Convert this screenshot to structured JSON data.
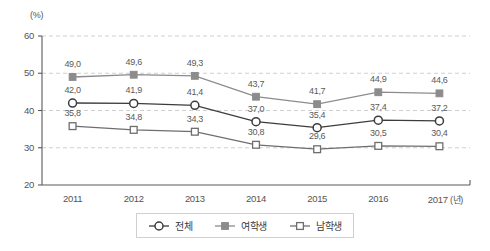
{
  "chart_data": {
    "type": "line",
    "title": "",
    "xlabel": "(년)",
    "ylabel": "(%)",
    "ylim": [
      20,
      60
    ],
    "yticks": [
      20,
      30,
      40,
      50,
      60
    ],
    "grid": true,
    "grid_style": "dashed",
    "legend_position": "bottom",
    "categories": [
      "2011",
      "2012",
      "2013",
      "2014",
      "2015",
      "2016",
      "2017"
    ],
    "series": [
      {
        "name": "전체",
        "marker": "open-circle",
        "color": "#3c3c3c",
        "values": [
          42.0,
          41.9,
          41.4,
          37.0,
          35.4,
          37.4,
          37.2
        ],
        "labels": [
          "42,0",
          "41,9",
          "41,4",
          "37,0",
          "35,4",
          "37,4",
          "37,2"
        ]
      },
      {
        "name": "여학생",
        "marker": "filled-square",
        "color": "#8c8c8c",
        "values": [
          49.0,
          49.6,
          49.3,
          43.7,
          41.7,
          44.9,
          44.6
        ],
        "labels": [
          "49,0",
          "49,6",
          "49,3",
          "43,7",
          "41,7",
          "44,9",
          "44,6"
        ]
      },
      {
        "name": "남학생",
        "marker": "open-square",
        "color": "#6e6e6e",
        "values": [
          35.8,
          34.8,
          34.3,
          30.8,
          29.6,
          30.5,
          30.4
        ],
        "labels": [
          "35,8",
          "34,8",
          "34,3",
          "30,8",
          "29,6",
          "30,5",
          "30,4"
        ]
      }
    ]
  },
  "axes": {
    "unit_label": "(%)",
    "x_unit_label": "(년)"
  },
  "legend": {
    "items": [
      {
        "label": "전체",
        "marker": "open-circle-icon"
      },
      {
        "label": "여학생",
        "marker": "filled-square-icon"
      },
      {
        "label": "남학생",
        "marker": "open-square-icon"
      }
    ]
  },
  "colors": {
    "total_line": "#3c3c3c",
    "female_line": "#8c8c8c",
    "male_line": "#6e6e6e",
    "grid": "#cfcfcf",
    "axis": "#5a5a5a",
    "text": "#555555"
  }
}
